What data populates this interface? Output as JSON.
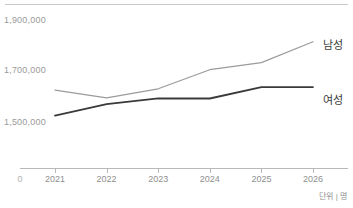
{
  "chart_data": {
    "type": "line",
    "title": "",
    "xlabel": "",
    "ylabel": "",
    "unit_caption": "단위 | 명",
    "categories": [
      "2021",
      "2022",
      "2023",
      "2024",
      "2025",
      "2026"
    ],
    "x_origin_label": "0",
    "y_ticks": [
      "1,900,000",
      "1,700,000",
      "1,500,000"
    ],
    "y_tick_values": [
      1900000,
      1700000,
      1500000
    ],
    "ylim": [
      1500000,
      1900000
    ],
    "grid": false,
    "legend_position": "right-inline",
    "series": [
      {
        "name": "남성",
        "color": "#9b9b9b",
        "values": [
          1625000,
          1595000,
          1630000,
          1705000,
          1733000,
          1815000
        ]
      },
      {
        "name": "여성",
        "color": "#3a3a3a",
        "values": [
          1525000,
          1570000,
          1593000,
          1592000,
          1637000,
          1637000
        ]
      }
    ]
  },
  "colors": {
    "male_line": "#9b9b9b",
    "female_line": "#3a3a3a",
    "axis": "#b8b8b8",
    "top_rule": "#c9c9c9",
    "tick_text": "#8f8f8f",
    "y_label_text": "#9a9a9a",
    "background": "#ffffff"
  }
}
